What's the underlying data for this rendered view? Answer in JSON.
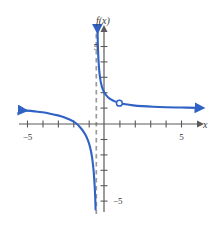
{
  "chart_data": {
    "type": "line",
    "title": "",
    "xlabel": "x",
    "ylabel": "f(x)",
    "xlim": [
      -6.0,
      6.5
    ],
    "ylim": [
      -6.2,
      6.2
    ],
    "grid": false,
    "legend": null,
    "x_tick_labels": [
      {
        "value": -5,
        "label": "−5"
      },
      {
        "value": 5,
        "label": "5"
      }
    ],
    "y_tick_labels": [
      {
        "value": 5,
        "label": "5"
      },
      {
        "value": -5,
        "label": "−5"
      }
    ],
    "x_ticks_unlabeled": [
      -4,
      -3,
      -2,
      -1,
      1,
      2,
      3,
      4,
      6
    ],
    "y_ticks_unlabeled": [
      1,
      2,
      3,
      4,
      -1,
      -2,
      -3,
      -4
    ],
    "annotations": [
      {
        "kind": "vertical-asymptote",
        "x": -0.5,
        "style": "dashed",
        "color": "#9a9a9a"
      },
      {
        "kind": "open-point",
        "x": 1.0,
        "y": 1.35,
        "label": "removable-discontinuity"
      }
    ],
    "series": [
      {
        "name": "left-branch",
        "color": "#2f62c4",
        "arrow_start": true,
        "arrow_end": false,
        "points": [
          [
            -5.45,
            0.9
          ],
          [
            -5.0,
            0.87
          ],
          [
            -4.5,
            0.82
          ],
          [
            -4.0,
            0.76
          ],
          [
            -3.5,
            0.67
          ],
          [
            -3.0,
            0.56
          ],
          [
            -2.6,
            0.44
          ],
          [
            -2.2,
            0.28
          ],
          [
            -2.0,
            0.17
          ],
          [
            -1.8,
            0.03
          ],
          [
            -1.6,
            -0.16
          ],
          [
            -1.4,
            -0.4
          ],
          [
            -1.2,
            -0.72
          ],
          [
            -1.05,
            -1.05
          ],
          [
            -0.95,
            -1.35
          ],
          [
            -0.85,
            -1.75
          ],
          [
            -0.78,
            -2.15
          ],
          [
            -0.72,
            -2.6
          ],
          [
            -0.67,
            -3.1
          ],
          [
            -0.63,
            -3.65
          ],
          [
            -0.6,
            -4.15
          ],
          [
            -0.575,
            -4.7
          ],
          [
            -0.558,
            -5.2
          ],
          [
            -0.547,
            -5.55
          ]
        ]
      },
      {
        "name": "right-branch",
        "color": "#2f62c4",
        "arrow_start": true,
        "arrow_end": true,
        "points": [
          [
            -0.425,
            6.35
          ],
          [
            -0.415,
            5.8
          ],
          [
            -0.4,
            5.2
          ],
          [
            -0.38,
            4.6
          ],
          [
            -0.355,
            4.1
          ],
          [
            -0.32,
            3.6
          ],
          [
            -0.275,
            3.15
          ],
          [
            -0.215,
            2.75
          ],
          [
            -0.135,
            2.42
          ],
          [
            -0.03,
            2.14
          ],
          [
            0.1,
            1.92
          ],
          [
            0.26,
            1.74
          ],
          [
            0.45,
            1.6
          ],
          [
            0.7,
            1.47
          ],
          [
            1.0,
            1.37
          ],
          [
            1.4,
            1.28
          ],
          [
            1.9,
            1.21
          ],
          [
            2.5,
            1.16
          ],
          [
            3.2,
            1.12
          ],
          [
            4.0,
            1.09
          ],
          [
            5.0,
            1.07
          ],
          [
            6.05,
            1.05
          ]
        ]
      }
    ]
  },
  "axes": {
    "x_axis_name": "x-axis",
    "y_axis_name": "y-axis",
    "x_label": "x",
    "y_label": "f(x)",
    "x_label_left": "−5",
    "x_label_right": "5",
    "y_label_top": "5",
    "y_label_bottom": "−5"
  },
  "colors": {
    "curve": "#2f62c4",
    "axis": "#5a5a5a",
    "asymptote": "#9a9a9a",
    "background": "#ffffff",
    "text": "#3a3a3a"
  }
}
